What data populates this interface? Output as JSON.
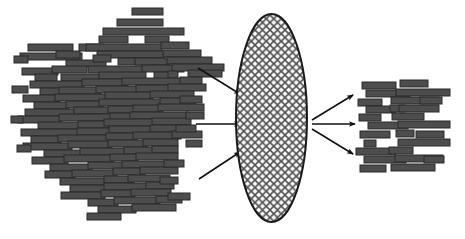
{
  "canvas": {
    "width": 465,
    "height": 239,
    "background": "#ffffff"
  },
  "figure": {
    "title": "",
    "bar_fill": "#4d4d4d",
    "bar_stroke": "#2b2b2b",
    "arrow_color": "#111111",
    "ellipse_stroke": "#1a1a1a",
    "ellipse_fill": "#f7f7f7",
    "hatch_color": "#555555"
  },
  "ellipse": {
    "name": "filter-ellipse",
    "cx": 271.5,
    "cy": 118,
    "rx": 35.5,
    "ry": 104,
    "hatch_spacing": 7.5,
    "hatch_angles": [
      45,
      -45
    ]
  },
  "arrows_in": [
    {
      "name": "arrow-in-top",
      "x1": 198,
      "y1": 68,
      "x2": 240,
      "y2": 94
    },
    {
      "name": "arrow-in-middle",
      "x1": 196,
      "y1": 124,
      "x2": 240,
      "y2": 124
    },
    {
      "name": "arrow-in-bottom",
      "x1": 199,
      "y1": 179,
      "x2": 240,
      "y2": 152
    }
  ],
  "arrows_out": [
    {
      "name": "arrow-out-top",
      "x1": 312,
      "y1": 120,
      "x2": 353,
      "y2": 95
    },
    {
      "name": "arrow-out-middle",
      "x1": 312,
      "y1": 124,
      "x2": 355,
      "y2": 124
    },
    {
      "name": "arrow-out-bottom",
      "x1": 312,
      "y1": 129,
      "x2": 353,
      "y2": 154
    }
  ],
  "left_cluster": {
    "name": "input-fragment-cluster",
    "count": 112,
    "bars": [
      [
        132,
        8,
        31,
        7
      ],
      [
        117,
        19,
        46,
        7
      ],
      [
        103,
        28,
        81,
        7
      ],
      [
        99,
        36,
        29,
        7
      ],
      [
        145,
        36,
        24,
        7
      ],
      [
        28,
        44,
        45,
        7
      ],
      [
        79,
        44,
        24,
        7
      ],
      [
        86,
        44,
        76,
        7
      ],
      [
        161,
        42,
        28,
        7
      ],
      [
        20,
        53,
        62,
        7
      ],
      [
        97,
        51,
        68,
        7
      ],
      [
        56,
        51,
        24,
        7
      ],
      [
        163,
        50,
        38,
        7
      ],
      [
        66,
        60,
        40,
        7
      ],
      [
        118,
        58,
        28,
        7
      ],
      [
        135,
        58,
        35,
        7
      ],
      [
        167,
        57,
        45,
        7
      ],
      [
        22,
        68,
        36,
        7
      ],
      [
        52,
        66,
        35,
        7
      ],
      [
        88,
        66,
        55,
        7
      ],
      [
        142,
        65,
        42,
        7
      ],
      [
        172,
        64,
        52,
        7
      ],
      [
        35,
        74,
        22,
        7
      ],
      [
        61,
        74,
        54,
        7
      ],
      [
        99,
        72,
        47,
        7
      ],
      [
        154,
        72,
        19,
        7
      ],
      [
        168,
        71,
        10,
        7
      ],
      [
        188,
        70,
        34,
        7
      ],
      [
        30,
        81,
        54,
        7
      ],
      [
        82,
        79,
        46,
        7
      ],
      [
        122,
        78,
        64,
        7
      ],
      [
        180,
        77,
        22,
        7
      ],
      [
        40,
        88,
        23,
        7
      ],
      [
        59,
        87,
        42,
        7
      ],
      [
        96,
        86,
        44,
        7
      ],
      [
        136,
        85,
        38,
        7
      ],
      [
        168,
        84,
        38,
        7
      ],
      [
        23,
        95,
        37,
        7
      ],
      [
        55,
        94,
        57,
        7
      ],
      [
        105,
        92,
        48,
        7
      ],
      [
        150,
        91,
        44,
        7
      ],
      [
        34,
        102,
        35,
        7
      ],
      [
        66,
        101,
        38,
        7
      ],
      [
        99,
        99,
        66,
        7
      ],
      [
        160,
        98,
        36,
        7
      ],
      [
        25,
        109,
        52,
        7
      ],
      [
        74,
        107,
        40,
        7
      ],
      [
        108,
        106,
        31,
        7
      ],
      [
        133,
        105,
        30,
        7
      ],
      [
        158,
        104,
        46,
        7
      ],
      [
        18,
        116,
        44,
        7
      ],
      [
        59,
        114,
        56,
        7
      ],
      [
        110,
        113,
        24,
        7
      ],
      [
        130,
        112,
        58,
        7
      ],
      [
        38,
        122,
        44,
        7
      ],
      [
        78,
        121,
        31,
        7
      ],
      [
        104,
        119,
        54,
        7
      ],
      [
        152,
        118,
        39,
        7
      ],
      [
        21,
        129,
        60,
        7
      ],
      [
        77,
        128,
        36,
        7
      ],
      [
        109,
        126,
        46,
        7
      ],
      [
        150,
        125,
        35,
        7
      ],
      [
        31,
        136,
        30,
        7
      ],
      [
        58,
        135,
        52,
        7
      ],
      [
        106,
        133,
        31,
        7
      ],
      [
        133,
        132,
        48,
        7
      ],
      [
        172,
        131,
        30,
        7
      ],
      [
        23,
        143,
        49,
        7
      ],
      [
        68,
        141,
        44,
        7
      ],
      [
        108,
        140,
        40,
        7
      ],
      [
        143,
        139,
        35,
        7
      ],
      [
        44,
        150,
        40,
        7
      ],
      [
        80,
        148,
        48,
        7
      ],
      [
        124,
        147,
        34,
        7
      ],
      [
        152,
        146,
        26,
        7
      ],
      [
        32,
        157,
        36,
        7
      ],
      [
        64,
        155,
        50,
        7
      ],
      [
        110,
        154,
        28,
        7
      ],
      [
        136,
        153,
        42,
        7
      ],
      [
        50,
        164,
        42,
        7
      ],
      [
        88,
        162,
        38,
        7
      ],
      [
        122,
        161,
        50,
        7
      ],
      [
        45,
        171,
        30,
        7
      ],
      [
        72,
        170,
        45,
        7
      ],
      [
        113,
        168,
        32,
        7
      ],
      [
        140,
        167,
        38,
        7
      ],
      [
        60,
        178,
        48,
        7
      ],
      [
        104,
        176,
        30,
        7
      ],
      [
        128,
        175,
        42,
        7
      ],
      [
        70,
        185,
        38,
        7
      ],
      [
        104,
        183,
        46,
        7
      ],
      [
        146,
        182,
        28,
        7
      ],
      [
        61,
        192,
        44,
        7
      ],
      [
        101,
        190,
        34,
        7
      ],
      [
        131,
        189,
        40,
        7
      ],
      [
        88,
        199,
        30,
        7
      ],
      [
        114,
        197,
        46,
        7
      ],
      [
        156,
        196,
        26,
        7
      ],
      [
        98,
        206,
        38,
        7
      ],
      [
        132,
        204,
        44,
        7
      ],
      [
        87,
        213,
        34,
        7
      ],
      [
        14,
        56,
        14,
        7
      ],
      [
        12,
        86,
        16,
        7
      ],
      [
        11,
        116,
        12,
        7
      ],
      [
        17,
        145,
        14,
        7
      ],
      [
        180,
        96,
        22,
        7
      ],
      [
        186,
        112,
        18,
        7
      ],
      [
        176,
        125,
        20,
        7
      ],
      [
        186,
        140,
        16,
        7
      ],
      [
        164,
        160,
        20,
        7
      ],
      [
        160,
        177,
        18,
        7
      ],
      [
        168,
        193,
        22,
        7
      ],
      [
        93,
        55,
        18,
        7
      ]
    ]
  },
  "right_cluster": {
    "name": "output-fragment-cluster",
    "count": 26,
    "bars": [
      [
        362,
        82,
        34,
        7
      ],
      [
        400,
        80,
        28,
        7
      ],
      [
        366,
        90,
        44,
        7
      ],
      [
        396,
        89,
        54,
        7
      ],
      [
        358,
        99,
        24,
        7
      ],
      [
        391,
        97,
        48,
        7
      ],
      [
        366,
        106,
        30,
        7
      ],
      [
        390,
        105,
        15,
        7
      ],
      [
        399,
        105,
        40,
        7
      ],
      [
        359,
        114,
        22,
        7
      ],
      [
        392,
        113,
        32,
        7
      ],
      [
        368,
        122,
        40,
        7
      ],
      [
        398,
        121,
        52,
        7
      ],
      [
        360,
        131,
        30,
        7
      ],
      [
        396,
        130,
        18,
        7
      ],
      [
        364,
        140,
        12,
        7
      ],
      [
        398,
        139,
        52,
        7
      ],
      [
        356,
        148,
        40,
        7
      ],
      [
        389,
        147,
        24,
        7
      ],
      [
        364,
        156,
        42,
        7
      ],
      [
        395,
        155,
        48,
        7
      ],
      [
        360,
        165,
        26,
        7
      ],
      [
        391,
        164,
        44,
        7
      ],
      [
        420,
        97,
        22,
        7
      ],
      [
        416,
        131,
        28,
        7
      ],
      [
        424,
        156,
        20,
        7
      ]
    ]
  }
}
